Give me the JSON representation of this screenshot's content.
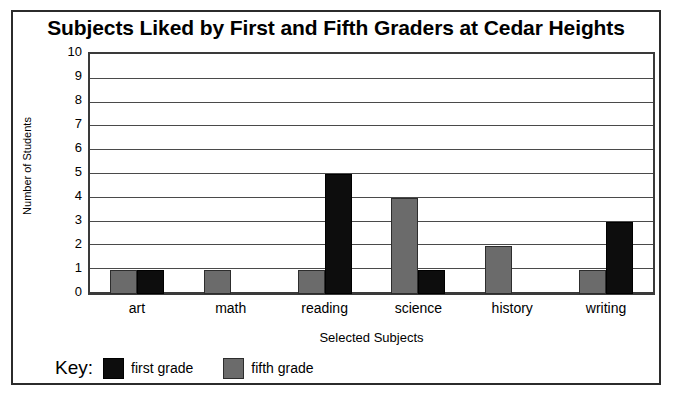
{
  "chart_data": {
    "type": "bar",
    "title": "Subjects Liked by First and Fifth Graders at Cedar Heights",
    "xlabel": "Selected Subjects",
    "ylabel": "Number of Students",
    "categories": [
      "art",
      "math",
      "reading",
      "science",
      "history",
      "writing"
    ],
    "series": [
      {
        "name": "fifth grade",
        "color": "#6b6b6b",
        "values": [
          1,
          1,
          1,
          4,
          2,
          1
        ]
      },
      {
        "name": "first grade",
        "color": "#0d0d0d",
        "values": [
          1,
          0,
          5,
          1,
          0,
          3
        ]
      }
    ],
    "ylim": [
      0,
      10
    ],
    "yticks": [
      "10",
      "9",
      "8",
      "7",
      "6",
      "5",
      "4",
      "3",
      "2",
      "1",
      "0"
    ],
    "grid": true,
    "legend_position": "bottom-left",
    "legend_title": "Key:",
    "bar_order": "fifth grade left, first grade right"
  },
  "legend": {
    "title": "Key:",
    "entries": [
      {
        "label": "first grade",
        "swatch": "black-swatch"
      },
      {
        "label": "fifth grade",
        "swatch": "gray-swatch"
      }
    ]
  }
}
